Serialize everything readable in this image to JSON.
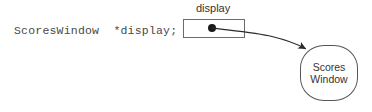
{
  "diagram": {
    "title_hint": "pointer-variable-to-object",
    "code": {
      "declaration": "ScoresWindow  *display;"
    },
    "pointer_variable": {
      "label": "display",
      "slot_value_icon": "filled-dot",
      "box": {
        "x": 183,
        "y": 19,
        "width": 62,
        "height": 19
      }
    },
    "target_object": {
      "line1": "Scores",
      "line2": "Window",
      "shape": "rounded-rect",
      "box": {
        "x": 300,
        "y": 45,
        "width": 58,
        "height": 56
      }
    },
    "connector": {
      "kind": "pointer-arrow",
      "from": [
        212,
        28
      ],
      "to": [
        308,
        50
      ],
      "arrowhead": "filled-triangle"
    },
    "colors": {
      "background": "#ffffff",
      "code_text": "#4a4a4a",
      "label_text": "#333333",
      "box_stroke": "#6b6b6b",
      "object_stroke": "#555555",
      "dot_fill": "#1a1a1a",
      "connector_stroke": "#2b2b2b"
    }
  }
}
